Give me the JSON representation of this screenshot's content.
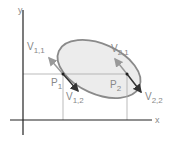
{
  "axes": {
    "x_label": "x",
    "y_label": "y"
  },
  "points": {
    "p1": {
      "label": "P",
      "sub": "1"
    },
    "p2": {
      "label": "P",
      "sub": "2"
    }
  },
  "vectors": {
    "v11": {
      "label": "V",
      "sub": "1,1"
    },
    "v12": {
      "label": "V",
      "sub": "1,2"
    },
    "v21": {
      "label": "V",
      "sub": "2,1"
    },
    "v22": {
      "label": "V",
      "sub": "2,2"
    }
  },
  "colors": {
    "ellipse_fill": "#ececec",
    "ellipse_stroke": "#8a8a8a",
    "axis": "#222222",
    "guide": "#aaaaaa",
    "arrow": "#333333",
    "arrow_light": "#999999"
  }
}
